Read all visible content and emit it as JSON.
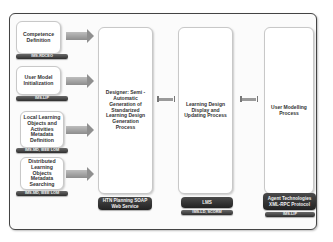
{
  "diagram": {
    "left_inputs": [
      {
        "label": "Competence Definition",
        "tag": "IMS-RDCEO"
      },
      {
        "label": "User Model Initialization",
        "tag": "IMS-LIP"
      },
      {
        "label": "Local Learning Objects and Activities Metadata Definition",
        "tag": "IMS-MD, IEEE LOM"
      },
      {
        "label": "Distributed Learning Objects Metadata Searching",
        "tag": "IMS-MD, IEEE LOM"
      }
    ],
    "processes": [
      {
        "label": "Designer: Semi - Automatic Generation of Standarized Learning Design Generation Process",
        "tags": [
          "HTN Planning SOAP Web Service"
        ]
      },
      {
        "label": "Learning Design Display and Updating Process",
        "tags": [
          "LMS",
          "IMS-LD, SCORM"
        ]
      },
      {
        "label": "User Modelling Process",
        "tags": [
          "Agent Technologies XML-RPC Protocol",
          "IMS-LIP"
        ]
      }
    ],
    "colors": {
      "frame_border": "#444444",
      "tag_bg": "#3a3a3a",
      "arrow": "#9a9a9a",
      "box_bg": "#ffffff"
    }
  }
}
